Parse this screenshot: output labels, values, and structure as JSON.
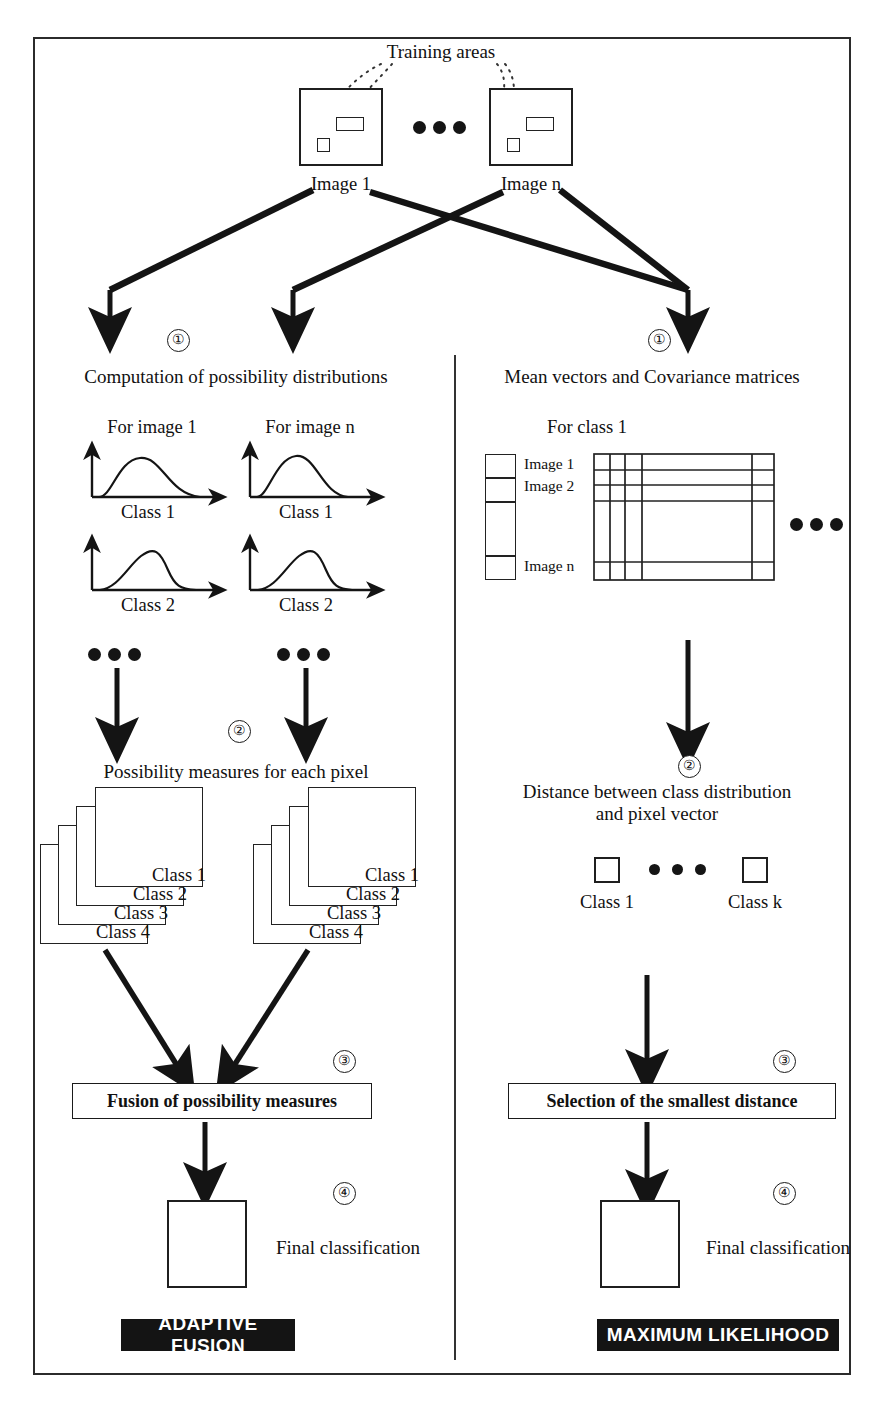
{
  "figure": {
    "training_areas_label": "Training areas",
    "ellipsis_glyph": "•••"
  },
  "sources": {
    "image_1": "Image 1",
    "image_n": "Image n"
  },
  "steps": {
    "one": "①",
    "two": "②",
    "three": "③",
    "four": "④"
  },
  "left_branch": {
    "step1_title": "Computation of possibility distributions",
    "panel_labels": [
      "For image 1",
      "For image n"
    ],
    "curve_labels": [
      "Class 1",
      "Class 2"
    ],
    "step2_title": "Possibility measures for each pixel",
    "stack_labels": [
      "Class 1",
      "Class 2",
      "Class 3",
      "Class 4"
    ],
    "step3_box": "Fusion of possibility measures",
    "step4_label": "Final classification",
    "banner": "ADAPTIVE FUSION"
  },
  "right_branch": {
    "step1_title": "Mean vectors and Covariance matrices",
    "matrix_title": "For class 1",
    "matrix_row_labels": [
      "Image 1",
      "Image 2",
      "Image n"
    ],
    "step2_title_line1": "Distance between class distribution",
    "step2_title_line2": "and pixel vector",
    "square_labels": [
      "Class 1",
      "Class k"
    ],
    "step3_box": "Selection of the smallest distance",
    "step4_label": "Final classification",
    "banner": "MAXIMUM LIKELIHOOD"
  },
  "colors": {
    "ink": "#1a1a1a",
    "banner_bg": "#141414",
    "banner_fg": "#ffffff",
    "paper": "#ffffff"
  }
}
